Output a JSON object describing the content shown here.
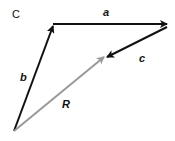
{
  "figure": {
    "panel_label": "C",
    "colors": {
      "dark_vector": "#111111",
      "resultant": "#999999",
      "background": "#ffffff"
    },
    "vectors": [
      {
        "name": "a",
        "label": "a",
        "from": [
          53,
          24
        ],
        "to": [
          167,
          24
        ],
        "color": "#111111"
      },
      {
        "name": "b",
        "label": "b",
        "from": [
          14,
          131
        ],
        "to": [
          53,
          26
        ],
        "color": "#111111"
      },
      {
        "name": "c",
        "label": "c",
        "from": [
          167,
          27
        ],
        "to": [
          107,
          57
        ],
        "color": "#111111"
      },
      {
        "name": "R",
        "label": "R",
        "from": [
          14,
          131
        ],
        "to": [
          104,
          57
        ],
        "color": "#999999"
      }
    ]
  }
}
